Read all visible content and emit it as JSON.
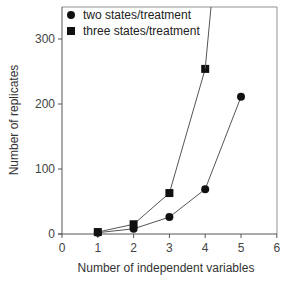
{
  "chart_data": {
    "type": "line",
    "title": "",
    "xlabel": "Number of independent variables",
    "ylabel": "Number of replicates",
    "xlim": [
      0,
      6
    ],
    "ylim": [
      0,
      350
    ],
    "x_ticks": [
      "0",
      "1",
      "2",
      "3",
      "4",
      "5",
      "6"
    ],
    "y_ticks": [
      "0",
      "100",
      "200",
      "300"
    ],
    "grid": false,
    "legend_position": "upper left",
    "x": [
      1,
      2,
      3,
      4,
      5
    ],
    "series": [
      {
        "name": "two states/treatment",
        "marker": "circle",
        "values": [
          2,
          8,
          26,
          69,
          211
        ]
      },
      {
        "name": "three states/treatment",
        "marker": "square",
        "values": [
          3,
          15,
          63,
          254,
          null
        ],
        "note": "line continues off the top of the chart after x=4"
      }
    ]
  },
  "legend": {
    "items": [
      {
        "label": "two states/treatment",
        "marker": "circle"
      },
      {
        "label": "three states/treatment",
        "marker": "square"
      }
    ]
  },
  "axes": {
    "xlabel": "Number of independent variables",
    "ylabel": "Number of replicates",
    "x_ticks": [
      "0",
      "1",
      "2",
      "3",
      "4",
      "5",
      "6"
    ],
    "y_ticks": [
      "0",
      "100",
      "200",
      "300"
    ]
  },
  "colors": {
    "line": "#555555",
    "marker": "#111111",
    "axis": "#555555"
  }
}
